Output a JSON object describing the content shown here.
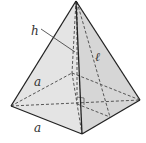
{
  "diagram": {
    "labels": {
      "height": "h",
      "slant_height": "ℓ",
      "base_side_back": "a",
      "base_side_front": "a"
    },
    "colors": {
      "face_left": "#e2e2e2",
      "face_right": "#d4d4d4",
      "edge": "#222222",
      "hidden_edge": "#555555"
    }
  }
}
